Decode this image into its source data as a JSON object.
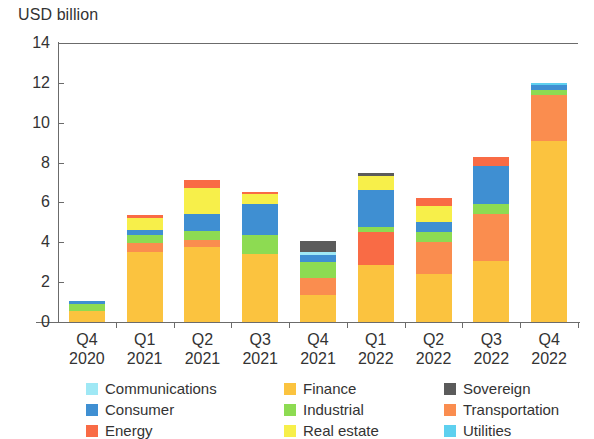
{
  "chart_data": {
    "type": "bar",
    "title": "",
    "subtitle": "",
    "ylabel": "USD billion",
    "xlabel": "",
    "ylim": [
      0,
      14
    ],
    "yticks": [
      0,
      2,
      4,
      6,
      8,
      10,
      12,
      14
    ],
    "grid": false,
    "stacked": true,
    "legend_position": "bottom",
    "categories": [
      "Q4\n2020",
      "Q1\n2021",
      "Q2\n2021",
      "Q3\n2021",
      "Q4\n2021",
      "Q1\n2022",
      "Q2\n2022",
      "Q3\n2022",
      "Q4\n2022"
    ],
    "category_lines": [
      [
        "Q4",
        "2020"
      ],
      [
        "Q1",
        "2021"
      ],
      [
        "Q2",
        "2021"
      ],
      [
        "Q3",
        "2021"
      ],
      [
        "Q4",
        "2021"
      ],
      [
        "Q1",
        "2022"
      ],
      [
        "Q2",
        "2022"
      ],
      [
        "Q3",
        "2022"
      ],
      [
        "Q4",
        "2022"
      ]
    ],
    "series": [
      {
        "name": "Finance",
        "color": "#fbc33f",
        "values": [
          0.55,
          3.5,
          3.75,
          3.4,
          1.35,
          2.85,
          2.4,
          3.05,
          9.1
        ]
      },
      {
        "name": "Transportation",
        "color": "#fa8d4f",
        "values": [
          0.0,
          0.45,
          0.35,
          0.0,
          0.85,
          0.0,
          1.6,
          2.35,
          2.3
        ]
      },
      {
        "name": "Energy",
        "color": "#f96b45",
        "values": [
          0.0,
          0.0,
          0.0,
          0.0,
          0.0,
          1.65,
          0.0,
          0.0,
          0.0
        ]
      },
      {
        "name": "Industrial",
        "color": "#8ddb52",
        "values": [
          0.35,
          0.4,
          0.45,
          0.95,
          0.8,
          0.25,
          0.5,
          0.5,
          0.25
        ]
      },
      {
        "name": "Consumer",
        "color": "#3f8fd2",
        "values": [
          0.18,
          0.25,
          0.85,
          1.55,
          0.35,
          1.9,
          0.5,
          1.95,
          0.25
        ]
      },
      {
        "name": "Communications",
        "color": "#9fe8f5",
        "values": [
          0.0,
          0.0,
          0.0,
          0.0,
          0.15,
          0.0,
          0.0,
          0.0,
          0.0
        ]
      },
      {
        "name": "Utilities",
        "color": "#5ed0ef",
        "values": [
          0.0,
          0.0,
          0.0,
          0.0,
          0.0,
          0.0,
          0.0,
          0.0,
          0.1
        ]
      },
      {
        "name": "Real estate",
        "color": "#f7ef4a",
        "values": [
          0.0,
          0.6,
          1.35,
          0.55,
          0.0,
          0.7,
          0.8,
          0.0,
          0.0
        ]
      },
      {
        "name": "Energy (top)",
        "color": "#f96b45",
        "values": [
          0.0,
          0.15,
          0.4,
          0.1,
          0.0,
          0.0,
          0.4,
          0.45,
          0.0
        ]
      },
      {
        "name": "Sovereign",
        "color": "#5b5b5b",
        "values": [
          0.0,
          0.0,
          0.0,
          0.0,
          0.55,
          0.15,
          0.0,
          0.0,
          0.0
        ]
      }
    ],
    "totals": [
      1.08,
      5.35,
      7.15,
      6.55,
      4.05,
      7.5,
      6.2,
      8.3,
      12.0
    ]
  },
  "legend": {
    "items": [
      {
        "label": "Communications",
        "color": "#9fe8f5"
      },
      {
        "label": "Consumer",
        "color": "#3f8fd2"
      },
      {
        "label": "Energy",
        "color": "#f96b45"
      },
      {
        "label": "Finance",
        "color": "#fbc33f"
      },
      {
        "label": "Industrial",
        "color": "#8ddb52"
      },
      {
        "label": "Real estate",
        "color": "#f7ef4a"
      },
      {
        "label": "Sovereign",
        "color": "#5b5b5b"
      },
      {
        "label": "Transportation",
        "color": "#fa8d4f"
      },
      {
        "label": "Utilities",
        "color": "#5ed0ef"
      }
    ]
  },
  "axis": {
    "y_title": "USD billion"
  }
}
